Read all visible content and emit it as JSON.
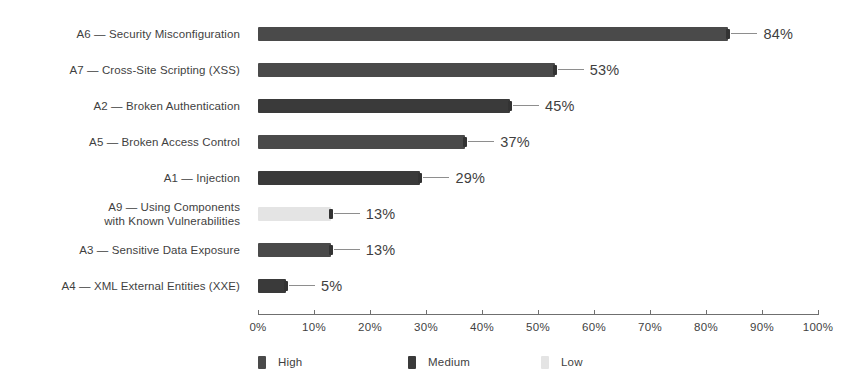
{
  "chart_data": {
    "type": "bar",
    "orientation": "horizontal",
    "title": "",
    "xlabel": "",
    "ylabel": "",
    "xlim": [
      0,
      100
    ],
    "grid": false,
    "legend_position": "bottom-left",
    "categories": [
      "A6 — Security Misconfiguration",
      "A7 — Cross-Site Scripting (XSS)",
      "A2 — Broken Authentication",
      "A5 — Broken Access Control",
      "A1 — Injection",
      "A9 — Using Components\nwith Known Vulnerabilities",
      "A3 — Sensitive Data Exposure",
      "A4 — XML External Entities (XXE)"
    ],
    "values": [
      84,
      53,
      45,
      37,
      29,
      13,
      13,
      5
    ],
    "value_labels": [
      "84%",
      "53%",
      "45%",
      "37%",
      "29%",
      "13%",
      "13%",
      "5%"
    ],
    "severities": [
      "High",
      "High",
      "Medium",
      "High",
      "Medium",
      "Low",
      "High",
      "Medium"
    ],
    "tick_labels": [
      "0%",
      "10%",
      "20%",
      "30%",
      "40%",
      "50%",
      "60%",
      "70%",
      "80%",
      "90%",
      "100%"
    ],
    "tick_values": [
      0,
      10,
      20,
      30,
      40,
      50,
      60,
      70,
      80,
      90,
      100
    ],
    "legend": [
      {
        "label": "High",
        "color": "#4a4a4a"
      },
      {
        "label": "Medium",
        "color": "#3a3a3a"
      },
      {
        "label": "Low",
        "color": "#e4e4e4"
      }
    ]
  },
  "colors": {
    "background": "#ffffff",
    "high": "#4a4a4a",
    "medium": "#3a3a3a",
    "low": "#e4e4e4",
    "axis": "#6f6f6f",
    "leader": "#8e8e8e",
    "text": "#3f3f3f"
  }
}
